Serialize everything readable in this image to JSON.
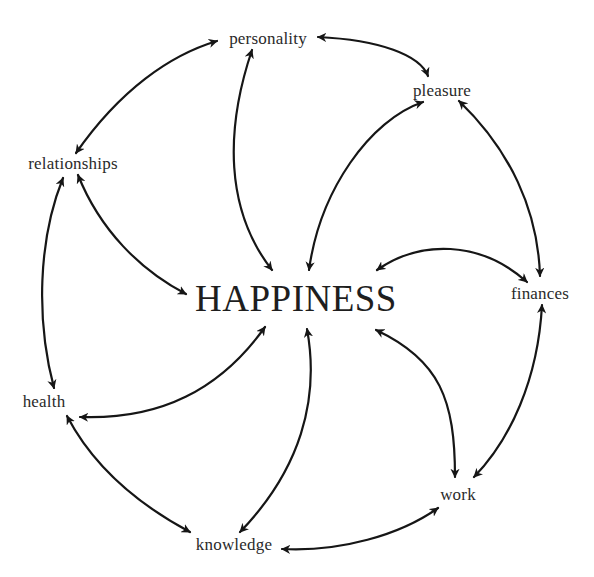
{
  "diagram": {
    "center": {
      "label": "HAPPINESS",
      "x": 296,
      "y": 298
    },
    "nodes": [
      {
        "id": "personality",
        "label": "personality",
        "x": 268,
        "y": 38
      },
      {
        "id": "pleasure",
        "label": "pleasure",
        "x": 442,
        "y": 90
      },
      {
        "id": "finances",
        "label": "finances",
        "x": 540,
        "y": 293
      },
      {
        "id": "work",
        "label": "work",
        "x": 458,
        "y": 494
      },
      {
        "id": "knowledge",
        "label": "knowledge",
        "x": 234,
        "y": 544
      },
      {
        "id": "health",
        "label": "health",
        "x": 44,
        "y": 401
      },
      {
        "id": "relationships",
        "label": "relationships",
        "x": 73,
        "y": 163
      }
    ],
    "ring_edges": [
      [
        "personality",
        "pleasure"
      ],
      [
        "pleasure",
        "finances"
      ],
      [
        "finances",
        "work"
      ],
      [
        "work",
        "knowledge"
      ],
      [
        "knowledge",
        "health"
      ],
      [
        "health",
        "relationships"
      ],
      [
        "relationships",
        "personality"
      ]
    ],
    "spoke_edges": [
      [
        "personality",
        "HAPPINESS"
      ],
      [
        "pleasure",
        "HAPPINESS"
      ],
      [
        "finances",
        "HAPPINESS"
      ],
      [
        "work",
        "HAPPINESS"
      ],
      [
        "knowledge",
        "HAPPINESS"
      ],
      [
        "health",
        "HAPPINESS"
      ],
      [
        "relationships",
        "HAPPINESS"
      ]
    ],
    "edge_style": "bidirectional-curved-arrow",
    "colors": {
      "stroke": "#161616",
      "text": "#2a2a2a",
      "background": "#ffffff"
    }
  }
}
